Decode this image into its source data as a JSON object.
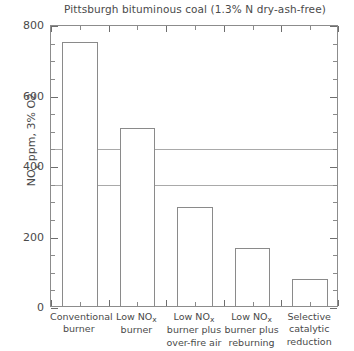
{
  "chart_data": {
    "type": "bar",
    "title": "Pittsburgh bituminous coal (1.3% N dry-ash-free)",
    "xlabel": "",
    "ylabel": "NOx ppm, 3% O2",
    "ylabel_parts": {
      "pre": "NO",
      "sub": "x",
      "post": " ppm, 3% O2"
    },
    "categories": [
      "Conventional burner",
      "Low NOx burner",
      "Low NOx burner plus over-fire air",
      "Low NOx burner plus reburning",
      "Selective catalytic reduction"
    ],
    "category_lines": [
      [
        {
          "text": "Conventional"
        },
        {
          "text": "burner"
        }
      ],
      [
        {
          "text": "Low NO",
          "sub": "x"
        },
        {
          "text": "burner"
        }
      ],
      [
        {
          "text": "Low NO",
          "sub": "x"
        },
        {
          "text": "burner plus"
        },
        {
          "text": "over-fire air"
        }
      ],
      [
        {
          "text": "Low NO",
          "sub": "x"
        },
        {
          "text": "burner plus"
        },
        {
          "text": "reburning"
        }
      ],
      [
        {
          "text": "Selective"
        },
        {
          "text": "catalytic"
        },
        {
          "text": "reduction"
        }
      ]
    ],
    "values": [
      750,
      505,
      280,
      165,
      78
    ],
    "ylim": [
      0,
      800
    ],
    "yticks": [
      0,
      200,
      400,
      600,
      800
    ],
    "ytick_labels": [
      "0",
      "200",
      "400",
      "600",
      "800"
    ],
    "yminor_step": 50,
    "grid": false,
    "reference_lines": [
      {
        "value": 450,
        "label": ""
      },
      {
        "value": 350,
        "label": ""
      }
    ],
    "legend": null,
    "bar_fill": "#ffffff",
    "bar_edge": "#8a8a8a",
    "axis_color": "#8c8c8c",
    "text_color": "#4a4a4a"
  }
}
